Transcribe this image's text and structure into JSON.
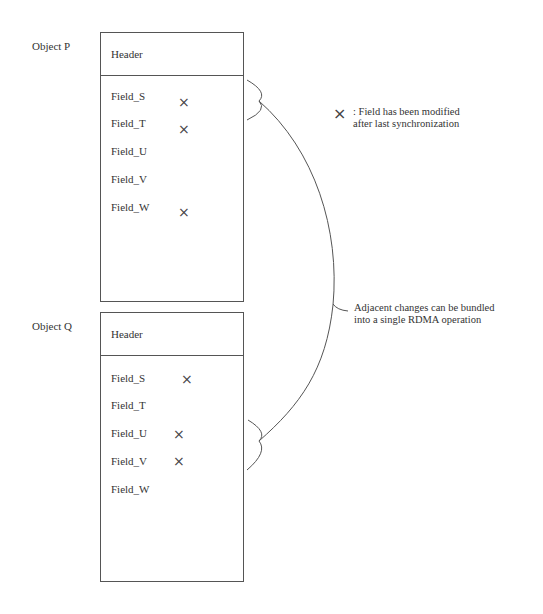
{
  "objects": [
    {
      "label": "Object P",
      "header": "Header",
      "fields": [
        {
          "name": "Field_S",
          "modified": true,
          "mark": "×"
        },
        {
          "name": "Field_T",
          "modified": true,
          "mark": "×"
        },
        {
          "name": "Field_U",
          "modified": false,
          "mark": ""
        },
        {
          "name": "Field_V",
          "modified": false,
          "mark": ""
        },
        {
          "name": "Field_W",
          "modified": true,
          "mark": "×"
        }
      ]
    },
    {
      "label": "Object Q",
      "header": "Header",
      "fields": [
        {
          "name": "Field_S",
          "modified": true,
          "mark": "×"
        },
        {
          "name": "Field_T",
          "modified": false,
          "mark": ""
        },
        {
          "name": "Field_U",
          "modified": true,
          "mark": "×"
        },
        {
          "name": "Field_V",
          "modified": true,
          "mark": "×"
        },
        {
          "name": "Field_W",
          "modified": false,
          "mark": ""
        }
      ]
    }
  ],
  "legend": {
    "mark": "×",
    "line1": ": Field has been modified",
    "line2": "after last synchronization"
  },
  "annotation": {
    "line1": "Adjacent changes can be bundled",
    "line2": "into a single RDMA operation"
  }
}
